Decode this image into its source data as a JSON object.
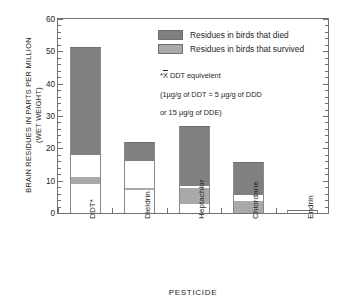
{
  "chart_data": {
    "type": "bar",
    "subtype": "stacked-bar",
    "title": "",
    "xlabel": "PESTICIDE",
    "ylabel": "BRAIN RESIDUES IN PARTS PER MILLION\n(WET WEIGHT)",
    "ylim": [
      0,
      60
    ],
    "ytick_step": 10,
    "yminor_step": 2,
    "ytick_labels": [
      "0",
      "10",
      "20",
      "30",
      "40",
      "50",
      "60"
    ],
    "ytick_values": [
      0,
      10,
      20,
      30,
      40,
      50,
      60
    ],
    "grid": false,
    "legend_position": "upper-right-inside",
    "categories": [
      "DDT*",
      "Dieldrin",
      "Heptachlor",
      "Chlordane",
      "Endrin"
    ],
    "totals": [
      51.2,
      22.0,
      27.0,
      15.7,
      0.8
    ],
    "series": [
      {
        "name": "Residues in birds that died",
        "color": "#808080",
        "values": [
          33.2,
          6.0,
          18.7,
          10.2,
          0.8
        ]
      },
      {
        "name": "Residues in birds that survived",
        "color": "#a9a9a9",
        "values": [
          2.0,
          0.8,
          4.7,
          3.5,
          0.0
        ]
      }
    ],
    "bars": [
      {
        "category": "DDT*",
        "total": 51.2,
        "segments": [
          {
            "from": 0.0,
            "to": 9.0,
            "fill": "white",
            "role": "unshaded-range"
          },
          {
            "from": 9.0,
            "to": 11.0,
            "fill": "light-gray",
            "role": "survived"
          },
          {
            "from": 11.0,
            "to": 18.0,
            "fill": "white",
            "role": "unshaded-range"
          },
          {
            "from": 18.0,
            "to": 51.2,
            "fill": "dark-gray",
            "role": "died"
          }
        ]
      },
      {
        "category": "Dieldrin",
        "total": 22.0,
        "segments": [
          {
            "from": 0.0,
            "to": 7.0,
            "fill": "white",
            "role": "unshaded-range"
          },
          {
            "from": 7.0,
            "to": 7.8,
            "fill": "light-gray",
            "role": "survived"
          },
          {
            "from": 7.8,
            "to": 16.0,
            "fill": "white",
            "role": "unshaded-range"
          },
          {
            "from": 16.0,
            "to": 22.0,
            "fill": "dark-gray",
            "role": "died"
          }
        ]
      },
      {
        "category": "Heptachlor",
        "total": 27.0,
        "segments": [
          {
            "from": 0.0,
            "to": 2.8,
            "fill": "white",
            "role": "unshaded-range"
          },
          {
            "from": 2.8,
            "to": 7.6,
            "fill": "light-gray",
            "role": "survived"
          },
          {
            "from": 7.6,
            "to": 8.3,
            "fill": "white",
            "role": "unshaded-range"
          },
          {
            "from": 8.3,
            "to": 27.0,
            "fill": "dark-gray",
            "role": "died"
          }
        ]
      },
      {
        "category": "Chlordane",
        "total": 15.7,
        "segments": [
          {
            "from": 0.0,
            "to": 3.6,
            "fill": "light-gray",
            "role": "survived"
          },
          {
            "from": 3.6,
            "to": 5.5,
            "fill": "white",
            "role": "unshaded-range"
          },
          {
            "from": 5.5,
            "to": 15.7,
            "fill": "dark-gray",
            "role": "died"
          }
        ]
      },
      {
        "category": "Endrin",
        "total": 0.8,
        "segments": [
          {
            "from": 0.0,
            "to": 0.8,
            "fill": "white",
            "role": "unshaded-range"
          }
        ]
      }
    ]
  },
  "legend": {
    "items": [
      {
        "label": "Residues in birds that died",
        "color": "#808080"
      },
      {
        "label": "Residues in birds that survived",
        "color": "#a9a9a9"
      }
    ]
  },
  "footnote": {
    "marker": "*",
    "symbol": "X",
    "line1_rest": " DDT equivelent",
    "line2": "(1µg/g of DDT = 5 µg/g of DDD",
    "line3": "or 15 µg/g of DDE)"
  },
  "axes": {
    "x_title": "PESTICIDE",
    "y_title": "BRAIN RESIDUES IN PARTS PER MILLION\n(WET WEIGHT)"
  },
  "colors": {
    "died": "#808080",
    "survived": "#a9a9a9",
    "bar_outline": "#8a8a8a",
    "axis": "#6f6f6f",
    "text": "#231f20",
    "background": "#ffffff"
  }
}
